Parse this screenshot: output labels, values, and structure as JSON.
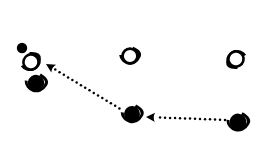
{
  "figure": {
    "background_color": "#ffffff",
    "ink_color": "#000000",
    "width": 259,
    "height": 145
  },
  "glyphs": [
    {
      "id": "glyph-top-left-dot",
      "name": "small-dot",
      "style": "filled",
      "label": "",
      "cx": 22,
      "cy": 48,
      "r": 5.2,
      "has_arc": false,
      "arc_rotation": 0
    },
    {
      "id": "glyph-upper-left",
      "name": "eye-outline-upper-left",
      "style": "outline",
      "label": "",
      "cx": 31,
      "cy": 62,
      "r": 7.6,
      "has_arc": true,
      "arc_rotation": -28
    },
    {
      "id": "glyph-lower-left",
      "name": "eye-filled-lower-left",
      "style": "filled",
      "label": "",
      "cx": 36,
      "cy": 83,
      "r": 8.2,
      "has_arc": true,
      "arc_rotation": 8
    },
    {
      "id": "glyph-top-middle",
      "name": "eye-outline-top-middle",
      "style": "outline",
      "label": "",
      "cx": 130,
      "cy": 56,
      "r": 7.4,
      "has_arc": true,
      "arc_rotation": 0
    },
    {
      "id": "glyph-top-right",
      "name": "eye-outline-top-right",
      "style": "outline",
      "label": "",
      "cx": 236,
      "cy": 59,
      "r": 7.6,
      "has_arc": true,
      "arc_rotation": 152
    },
    {
      "id": "glyph-bottom-middle",
      "name": "eye-filled-bottom-middle",
      "style": "filled",
      "label": "",
      "cx": 132,
      "cy": 114,
      "r": 8.0,
      "has_arc": true,
      "arc_rotation": 4
    },
    {
      "id": "glyph-bottom-right",
      "name": "eye-filled-bottom-right",
      "style": "filled",
      "label": "",
      "cx": 238,
      "cy": 122,
      "r": 8.4,
      "has_arc": true,
      "arc_rotation": 6
    }
  ],
  "arrows": [
    {
      "id": "arrow-mid-to-left",
      "name": "dotted-arrow-middle-to-left",
      "label": "",
      "from_x": 122,
      "from_y": 110,
      "to_x": 46,
      "to_y": 64,
      "style": "dotted",
      "head": "end",
      "dot_radius": 1.25,
      "dot_spacing": 5.0
    },
    {
      "id": "arrow-right-to-mid",
      "name": "dotted-arrow-right-to-middle",
      "label": "",
      "from_x": 228,
      "from_y": 120,
      "to_x": 146,
      "to_y": 117,
      "style": "dotted",
      "head": "end",
      "dot_radius": 1.25,
      "dot_spacing": 5.0
    }
  ]
}
